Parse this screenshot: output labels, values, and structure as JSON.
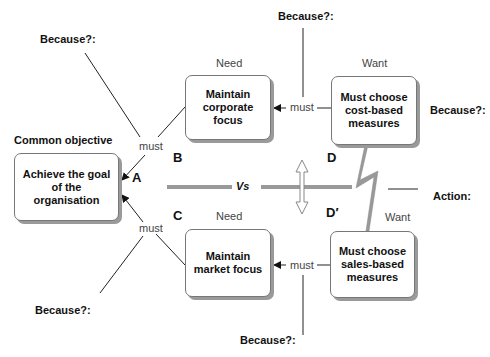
{
  "diagram": {
    "type": "evaporating cloud / conflict diagram",
    "objective_heading": "Common objective",
    "boxes": {
      "A": {
        "letter": "A",
        "text": "Achieve the goal of the organisation"
      },
      "B": {
        "letter": "B",
        "heading": "Need",
        "text": "Maintain corporate focus"
      },
      "C": {
        "letter": "C",
        "heading": "Need",
        "text": "Maintain market focus"
      },
      "D": {
        "letter": "D",
        "heading": "Want",
        "text": "Must choose cost-based measures"
      },
      "D_prime": {
        "letter": "D′",
        "heading": "Want",
        "text": "Must choose sales-based measures"
      }
    },
    "connector_label": "must",
    "because_label": "Because?:",
    "versus_label": "Vs",
    "action_label": "Action:",
    "colors": {
      "box_border": "#777777",
      "box_shadow": "#9a9a9a",
      "conflict_bar": "#999999",
      "lines": "#222222"
    }
  }
}
